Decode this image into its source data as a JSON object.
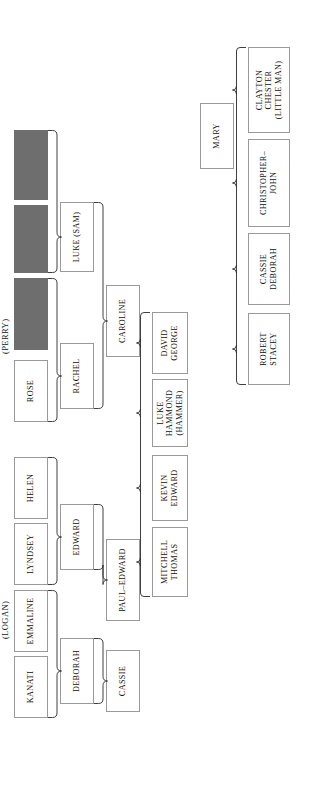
{
  "diagram": {
    "orientation": "rotated-90",
    "generation_labels": [
      {
        "id": "perry",
        "text": "(PERRY)"
      },
      {
        "id": "logan",
        "text": "(LOGAN)"
      }
    ],
    "colors": {
      "redacted_fill": "#6e6e6e",
      "box_border": "#9a9a9a",
      "box_fill": "#ffffff",
      "text": "#0f0f0f",
      "brace": "#2a2a2a",
      "background": "#ffffff"
    },
    "generations": [
      {
        "id": "gen1",
        "label_ref": "perry",
        "nodes": [
          {
            "id": "g1-redacted-1",
            "lines": [
              ""
            ],
            "redacted": true
          },
          {
            "id": "g1-redacted-2",
            "lines": [
              ""
            ],
            "redacted": true
          },
          {
            "id": "g1-redacted-3",
            "lines": [
              ""
            ],
            "redacted": true
          },
          {
            "id": "g1-rose",
            "lines": [
              "ROSE"
            ],
            "redacted": false
          },
          {
            "id": "g1-helen",
            "lines": [
              "HELEN"
            ],
            "redacted": false
          },
          {
            "id": "g1-lyndsey",
            "lines": [
              "LYNDSEY"
            ],
            "redacted": false
          },
          {
            "id": "g1-emmaline",
            "lines": [
              "EMMALINE"
            ],
            "redacted": false
          },
          {
            "id": "g1-kanati",
            "lines": [
              "KANATI"
            ],
            "redacted": false
          }
        ]
      },
      {
        "id": "gen2",
        "nodes": [
          {
            "id": "g2-luke-sam",
            "lines": [
              "LUKE (SAM)"
            ],
            "redacted": false
          },
          {
            "id": "g2-rachel",
            "lines": [
              "RACHEL"
            ],
            "redacted": false
          },
          {
            "id": "g2-edward",
            "lines": [
              "EDWARD"
            ],
            "redacted": false
          },
          {
            "id": "g2-deborah",
            "lines": [
              "DEBORAH"
            ],
            "redacted": false
          }
        ]
      },
      {
        "id": "gen3",
        "nodes": [
          {
            "id": "g3-caroline",
            "lines": [
              "CAROLINE"
            ],
            "redacted": false
          },
          {
            "id": "g3-paul-edward",
            "lines": [
              "PAUL–EDWARD"
            ],
            "redacted": false
          },
          {
            "id": "g3-cassie",
            "lines": [
              "CASSIE"
            ],
            "redacted": false
          }
        ]
      },
      {
        "id": "gen4",
        "nodes": [
          {
            "id": "g4-david-george",
            "lines": [
              "DAVID",
              "GEORGE"
            ],
            "redacted": false
          },
          {
            "id": "g4-luke-hammond",
            "lines": [
              "LUKE",
              "HAMMOND",
              "(HAMMER)"
            ],
            "redacted": false
          },
          {
            "id": "g4-kevin-edward",
            "lines": [
              "KEVIN",
              "EDWARD"
            ],
            "redacted": false
          },
          {
            "id": "g4-mitchell-thomas",
            "lines": [
              "MITCHELL",
              "THOMAS"
            ],
            "redacted": false
          }
        ]
      },
      {
        "id": "gen5",
        "nodes": [
          {
            "id": "g5-mary",
            "lines": [
              "MARY"
            ],
            "redacted": false
          }
        ]
      },
      {
        "id": "gen6",
        "nodes": [
          {
            "id": "g6-clayton-chester",
            "lines": [
              "CLAYTON",
              "CHESTER",
              "(LITTLE MAN)"
            ],
            "redacted": false
          },
          {
            "id": "g6-christopher-john",
            "lines": [
              "CHRISTOPHER–",
              "JOHN"
            ],
            "redacted": false
          },
          {
            "id": "g6-cassie-deborah",
            "lines": [
              "CASSIE",
              "DEBORAH"
            ],
            "redacted": false
          },
          {
            "id": "g6-robert-stacey",
            "lines": [
              "ROBERT",
              "STACEY"
            ],
            "redacted": false
          }
        ]
      }
    ],
    "braces": [
      {
        "id": "brace-luke-sam",
        "joins": [
          "g1-redacted-1",
          "g1-redacted-2"
        ],
        "to": "g2-luke-sam"
      },
      {
        "id": "brace-rachel",
        "joins": [
          "g1-redacted-3",
          "g1-rose"
        ],
        "to": "g2-rachel"
      },
      {
        "id": "brace-edward",
        "joins": [
          "g1-helen",
          "g1-lyndsey"
        ],
        "to": "g2-edward"
      },
      {
        "id": "brace-deborah",
        "joins": [
          "g1-emmaline",
          "g1-kanati"
        ],
        "to": "g2-deborah"
      },
      {
        "id": "brace-caroline",
        "joins": [
          "g2-luke-sam",
          "g2-rachel"
        ],
        "to": "g3-caroline"
      },
      {
        "id": "brace-paul-edward",
        "joins": [
          "g2-edward"
        ],
        "to": "g3-paul-edward"
      },
      {
        "id": "brace-cassie",
        "joins": [
          "g2-deborah"
        ],
        "to": "g3-cassie"
      },
      {
        "id": "brace-children",
        "joins": [
          "g3-caroline",
          "g3-paul-edward"
        ],
        "to": "gen4-group"
      },
      {
        "id": "brace-grandchildren",
        "joins": [
          "g5-mary"
        ],
        "to": "gen6-group"
      }
    ]
  }
}
